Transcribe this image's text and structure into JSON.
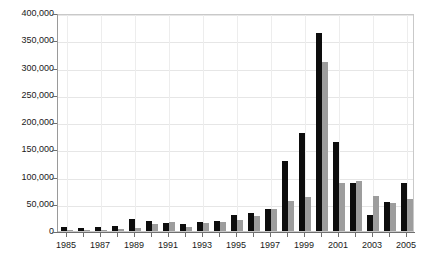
{
  "chart_data": {
    "type": "bar",
    "title": "",
    "subtitle": "",
    "xlabel": "",
    "ylabel": "",
    "grid": true,
    "legend": "none",
    "ylim": [
      0,
      400000
    ],
    "ytick_values": [
      0,
      50000,
      100000,
      150000,
      200000,
      250000,
      300000,
      350000,
      400000
    ],
    "ytick_labels": [
      "0",
      "50,000",
      "100,000",
      "150,000",
      "200,000",
      "250,000",
      "300,000",
      "350,000",
      "400,000"
    ],
    "categories": [
      "1985",
      "1986",
      "1987",
      "1988",
      "1989",
      "1990",
      "1991",
      "1992",
      "1993",
      "1994",
      "1995",
      "1996",
      "1997",
      "1998",
      "1999",
      "2000",
      "2001",
      "2002",
      "2003",
      "2004",
      "2005"
    ],
    "xtick_labels_shown": [
      "1985",
      "1987",
      "1989",
      "1991",
      "1993",
      "1995",
      "1997",
      "1999",
      "2001",
      "2003",
      "2005"
    ],
    "series": [
      {
        "name": "series-1",
        "color": "#0d0d0d",
        "values": [
          8000,
          6000,
          7000,
          10000,
          22000,
          18000,
          14000,
          12000,
          17000,
          18000,
          30000,
          33000,
          40000,
          128000,
          180000,
          363000,
          163000,
          88000,
          30000,
          53000,
          88000
        ]
      },
      {
        "name": "series-2",
        "color": "#9d9d9d",
        "values": [
          1000,
          1000,
          1000,
          3000,
          6000,
          13000,
          17000,
          8000,
          14000,
          17000,
          20000,
          28000,
          40000,
          55000,
          62000,
          310000,
          88000,
          92000,
          65000,
          52000,
          58000
        ]
      }
    ]
  }
}
